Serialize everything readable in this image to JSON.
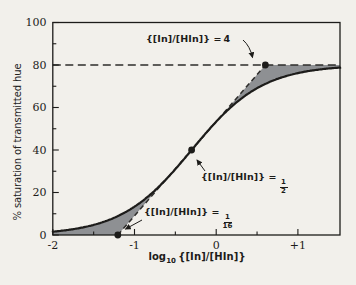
{
  "figure": {
    "background": "#f2f0eb",
    "ink": "#1d1c1a",
    "gray_fill": "#8e9093",
    "dash_color": "#2e2d2b"
  },
  "axis": {
    "y_label": "% saturation of transmitted hue",
    "x_label_prefix": "log",
    "x_label_sub": "10",
    "x_label_arg": "{[In]/[HIn]}"
  },
  "annotations": {
    "a4": {
      "label": "{[In]/[HIn]} =",
      "value": "4"
    },
    "a12": {
      "label": "{[In]/[HIn]} =",
      "num": "1",
      "den": "2"
    },
    "a116": {
      "label": "{[In]/[HIn]} =",
      "num": "1",
      "den": "16"
    }
  },
  "chart_data": {
    "type": "line",
    "title": "",
    "xlabel": "log10 {[In]/[HIn]}",
    "ylabel": "% saturation of transmitted hue",
    "xlim": [
      -2,
      1.517
    ],
    "ylim": [
      0,
      100
    ],
    "grid": false,
    "x_ticks_major": [
      -2,
      -1,
      0,
      1
    ],
    "x_tick_labels": [
      "-2",
      "-1",
      "0",
      "+1"
    ],
    "x_ticks_minor": [
      -1.5,
      -0.5,
      0.5
    ],
    "y_ticks_major": [
      0,
      20,
      40,
      60,
      80,
      100
    ],
    "y_tick_labels": [
      "0",
      "20",
      "40",
      "60",
      "80",
      "100"
    ],
    "y_ticks_minor": [
      10,
      30,
      50,
      70,
      90
    ],
    "asymptote_y": 80,
    "curve": {
      "formula": "y = 80 / (1 + 10^(-(x - log10(1/2))))",
      "max_saturation": 80,
      "midpoint_log": -0.301,
      "x": [
        -2,
        -1.75,
        -1.5,
        -1.25,
        -1,
        -0.75,
        -0.5,
        -0.25,
        0,
        0.25,
        0.5,
        0.75,
        1,
        1.25,
        1.5
      ],
      "y": [
        1.6,
        2.8,
        4.8,
        8.1,
        13.3,
        21.0,
        31.0,
        42.3,
        53.3,
        62.4,
        69.1,
        73.5,
        76.2,
        77.8,
        78.7
      ]
    },
    "tangent_line": {
      "x1": -1.204,
      "y1": 0,
      "x2": 0.602,
      "y2": 80,
      "style": "dashed"
    },
    "key_points": [
      {
        "ratio": "1/16",
        "x": -1.204,
        "y": 0
      },
      {
        "ratio": "1/2",
        "x": -0.301,
        "y": 40
      },
      {
        "ratio": "4",
        "x": 0.602,
        "y": 80
      }
    ],
    "shaded_regions": "gray areas between the S-curve and the straight tangent / 80% asymptote"
  }
}
